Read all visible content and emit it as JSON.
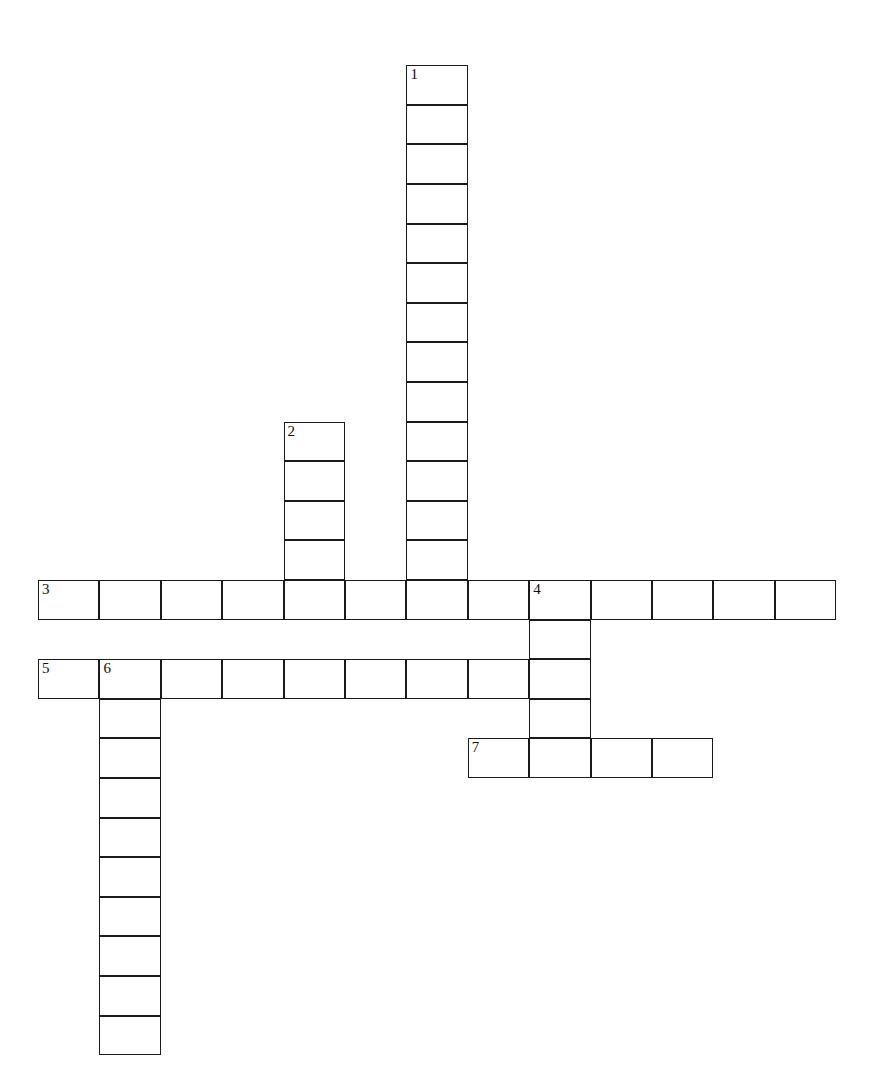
{
  "puzzle": {
    "title": "Crossword Puzzle Grid",
    "background_color": "#ffffff",
    "cell_color": "#ffffff",
    "line_color": "#1a1a1a",
    "number_color": "#111111",
    "geometry": {
      "origin_x": 38,
      "origin_y": 580,
      "cell_width": 61.4,
      "cell_height": 39.6,
      "grid_cols": 13,
      "grid_rows": 25,
      "row_of_first_across": 13
    },
    "entries": [
      {
        "number": "1",
        "direction": "down",
        "length": 14,
        "start_col": 6,
        "start_row": 0
      },
      {
        "number": "2",
        "direction": "down",
        "length": 5,
        "start_col": 4,
        "start_row": 9
      },
      {
        "number": "3",
        "direction": "across",
        "length": 13,
        "start_col": 0,
        "start_row": 13
      },
      {
        "number": "4",
        "direction": "down",
        "length": 5,
        "start_col": 8,
        "start_row": 13
      },
      {
        "number": "5",
        "direction": "across",
        "length": 9,
        "start_col": 0,
        "start_row": 15
      },
      {
        "number": "6",
        "direction": "down",
        "length": 10,
        "start_col": 1,
        "start_row": 15
      },
      {
        "number": "7",
        "direction": "across",
        "length": 4,
        "start_col": 7,
        "start_row": 17
      }
    ],
    "cells": [
      {
        "col": 6,
        "row": 0,
        "number": "1",
        "letter": ""
      },
      {
        "col": 6,
        "row": 1,
        "number": "",
        "letter": ""
      },
      {
        "col": 6,
        "row": 2,
        "number": "",
        "letter": ""
      },
      {
        "col": 6,
        "row": 3,
        "number": "",
        "letter": ""
      },
      {
        "col": 6,
        "row": 4,
        "number": "",
        "letter": ""
      },
      {
        "col": 6,
        "row": 5,
        "number": "",
        "letter": ""
      },
      {
        "col": 6,
        "row": 6,
        "number": "",
        "letter": ""
      },
      {
        "col": 6,
        "row": 7,
        "number": "",
        "letter": ""
      },
      {
        "col": 6,
        "row": 8,
        "number": "",
        "letter": ""
      },
      {
        "col": 6,
        "row": 9,
        "number": "",
        "letter": ""
      },
      {
        "col": 6,
        "row": 10,
        "number": "",
        "letter": ""
      },
      {
        "col": 6,
        "row": 11,
        "number": "",
        "letter": ""
      },
      {
        "col": 6,
        "row": 12,
        "number": "",
        "letter": ""
      },
      {
        "col": 4,
        "row": 9,
        "number": "2",
        "letter": ""
      },
      {
        "col": 4,
        "row": 10,
        "number": "",
        "letter": ""
      },
      {
        "col": 4,
        "row": 11,
        "number": "",
        "letter": ""
      },
      {
        "col": 4,
        "row": 12,
        "number": "",
        "letter": ""
      },
      {
        "col": 0,
        "row": 13,
        "number": "3",
        "letter": ""
      },
      {
        "col": 1,
        "row": 13,
        "number": "",
        "letter": ""
      },
      {
        "col": 2,
        "row": 13,
        "number": "",
        "letter": ""
      },
      {
        "col": 3,
        "row": 13,
        "number": "",
        "letter": ""
      },
      {
        "col": 4,
        "row": 13,
        "number": "",
        "letter": ""
      },
      {
        "col": 5,
        "row": 13,
        "number": "",
        "letter": ""
      },
      {
        "col": 6,
        "row": 13,
        "number": "",
        "letter": ""
      },
      {
        "col": 7,
        "row": 13,
        "number": "",
        "letter": ""
      },
      {
        "col": 8,
        "row": 13,
        "number": "4",
        "letter": ""
      },
      {
        "col": 9,
        "row": 13,
        "number": "",
        "letter": ""
      },
      {
        "col": 10,
        "row": 13,
        "number": "",
        "letter": ""
      },
      {
        "col": 11,
        "row": 13,
        "number": "",
        "letter": ""
      },
      {
        "col": 12,
        "row": 13,
        "number": "",
        "letter": ""
      },
      {
        "col": 8,
        "row": 14,
        "number": "",
        "letter": ""
      },
      {
        "col": 8,
        "row": 16,
        "number": "",
        "letter": ""
      },
      {
        "col": 0,
        "row": 15,
        "number": "5",
        "letter": ""
      },
      {
        "col": 1,
        "row": 15,
        "number": "6",
        "letter": ""
      },
      {
        "col": 2,
        "row": 15,
        "number": "",
        "letter": ""
      },
      {
        "col": 3,
        "row": 15,
        "number": "",
        "letter": ""
      },
      {
        "col": 4,
        "row": 15,
        "number": "",
        "letter": ""
      },
      {
        "col": 5,
        "row": 15,
        "number": "",
        "letter": ""
      },
      {
        "col": 6,
        "row": 15,
        "number": "",
        "letter": ""
      },
      {
        "col": 7,
        "row": 15,
        "number": "",
        "letter": ""
      },
      {
        "col": 8,
        "row": 15,
        "number": "",
        "letter": ""
      },
      {
        "col": 1,
        "row": 16,
        "number": "",
        "letter": ""
      },
      {
        "col": 1,
        "row": 17,
        "number": "",
        "letter": ""
      },
      {
        "col": 1,
        "row": 18,
        "number": "",
        "letter": ""
      },
      {
        "col": 1,
        "row": 19,
        "number": "",
        "letter": ""
      },
      {
        "col": 1,
        "row": 20,
        "number": "",
        "letter": ""
      },
      {
        "col": 1,
        "row": 21,
        "number": "",
        "letter": ""
      },
      {
        "col": 1,
        "row": 22,
        "number": "",
        "letter": ""
      },
      {
        "col": 1,
        "row": 23,
        "number": "",
        "letter": ""
      },
      {
        "col": 1,
        "row": 24,
        "number": "",
        "letter": ""
      },
      {
        "col": 7,
        "row": 17,
        "number": "7",
        "letter": ""
      },
      {
        "col": 8,
        "row": 17,
        "number": "",
        "letter": ""
      },
      {
        "col": 9,
        "row": 17,
        "number": "",
        "letter": ""
      },
      {
        "col": 10,
        "row": 17,
        "number": "",
        "letter": ""
      }
    ]
  }
}
